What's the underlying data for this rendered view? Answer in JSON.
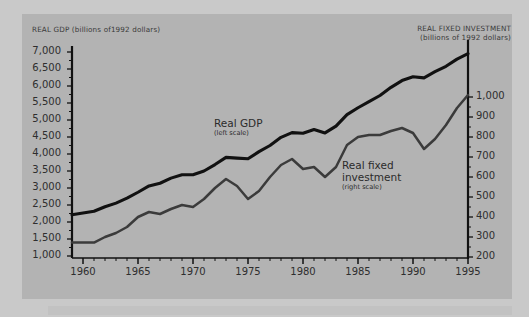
{
  "figure": {
    "background_color": "#c9c9c9",
    "panel_color": "#b3b3b3",
    "left_axis_title": "REAL GDP (billions of1992 dollars)",
    "right_axis_title_line1": "REAL FIXED INVESTMENT",
    "right_axis_title_line2": "(billions of 1992 dollars)",
    "gdp_series_color": "#111111",
    "investment_series_color": "#3b3b3b",
    "axis_color": "#111111",
    "text_color": "#2e2e2e"
  },
  "annotations": {
    "gdp_label": "Real GDP",
    "gdp_sublabel": "(left scale)",
    "investment_label_line1": "Real fixed",
    "investment_label_line2": "investment",
    "investment_sublabel": "(right scale)"
  },
  "chart_data": {
    "type": "line",
    "title": "",
    "xlabel": "",
    "ylabel": "REAL GDP (billions of 1992 dollars)",
    "y2label": "REAL FIXED INVESTMENT (billions of 1992 dollars)",
    "grid": false,
    "legend": "inline-annotations",
    "xlim": [
      1959,
      1995
    ],
    "ylim": [
      1000,
      7000
    ],
    "y2lim": [
      200,
      1000
    ],
    "xticks": [
      1960,
      1965,
      1970,
      1975,
      1980,
      1985,
      1990,
      1995
    ],
    "xtick_labels": [
      "1960",
      "1965",
      "1970",
      "1975",
      "1980",
      "1985",
      "1990",
      "1995"
    ],
    "xtick_minor_step": 1,
    "yticks": [
      1000,
      1500,
      2000,
      2500,
      3000,
      3500,
      4000,
      4500,
      5000,
      5500,
      6000,
      6500,
      7000
    ],
    "ytick_labels": [
      "1,000",
      "1,500",
      "2,000",
      "2,500",
      "3,000",
      "3,500",
      "4,000",
      "4,500",
      "5,000",
      "5,500",
      "6,000",
      "6,500",
      "7,000"
    ],
    "y2ticks": [
      200,
      300,
      400,
      500,
      600,
      700,
      800,
      900,
      1000
    ],
    "y2tick_labels": [
      "200",
      "300",
      "400",
      "500",
      "600",
      "700",
      "800",
      "900",
      "1,000"
    ],
    "x": [
      1959,
      1960,
      1961,
      1962,
      1963,
      1964,
      1965,
      1966,
      1967,
      1968,
      1969,
      1970,
      1971,
      1972,
      1973,
      1974,
      1975,
      1976,
      1977,
      1978,
      1979,
      1980,
      1981,
      1982,
      1983,
      1984,
      1985,
      1986,
      1987,
      1988,
      1989,
      1990,
      1991,
      1992,
      1993,
      1994,
      1995
    ],
    "series": [
      {
        "name": "Real GDP",
        "axis": "left",
        "units": "billions of 1992 dollars",
        "values": [
          2212,
          2262,
          2315,
          2450,
          2555,
          2700,
          2875,
          3060,
          3140,
          3290,
          3390,
          3390,
          3500,
          3690,
          3900,
          3880,
          3860,
          4070,
          4250,
          4490,
          4630,
          4610,
          4720,
          4620,
          4820,
          5160,
          5360,
          5540,
          5720,
          5960,
          6160,
          6270,
          6240,
          6420,
          6580,
          6790,
          6950
        ]
      },
      {
        "name": "Real fixed investment",
        "axis": "right",
        "units": "billions of 1992 dollars",
        "values": [
          272,
          272,
          272,
          300,
          320,
          350,
          400,
          425,
          415,
          440,
          460,
          450,
          490,
          545,
          590,
          555,
          490,
          530,
          600,
          660,
          690,
          640,
          650,
          600,
          650,
          760,
          800,
          810,
          810,
          830,
          845,
          820,
          740,
          790,
          860,
          945,
          1010
        ]
      }
    ]
  }
}
